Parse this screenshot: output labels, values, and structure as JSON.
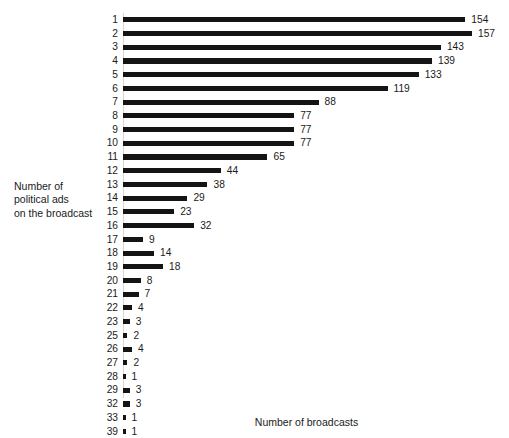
{
  "chart_data": {
    "type": "bar",
    "orientation": "horizontal",
    "title": "",
    "xlabel": "Number of  broadcasts",
    "ylabel": "Number of\npolitical ads\non the broadcast",
    "categories": [
      "1",
      "2",
      "3",
      "4",
      "5",
      "6",
      "7",
      "8",
      "9",
      "10",
      "11",
      "12",
      "13",
      "14",
      "15",
      "16",
      "17",
      "18",
      "19",
      "20",
      "21",
      "22",
      "23",
      "25",
      "26",
      "27",
      "28",
      "29",
      "32",
      "33",
      "39"
    ],
    "values": [
      154,
      157,
      143,
      139,
      133,
      119,
      88,
      77,
      77,
      77,
      65,
      44,
      38,
      29,
      23,
      32,
      9,
      14,
      18,
      8,
      7,
      4,
      3,
      2,
      4,
      2,
      1,
      3,
      3,
      1,
      1
    ],
    "xlim": [
      0,
      157
    ],
    "grid": false,
    "legend": null,
    "bar_color": "#141414",
    "data_labels": true
  },
  "axis": {
    "y_caption": "Number of\npolitical ads\non the broadcast",
    "x_caption": "Number of  broadcasts"
  }
}
